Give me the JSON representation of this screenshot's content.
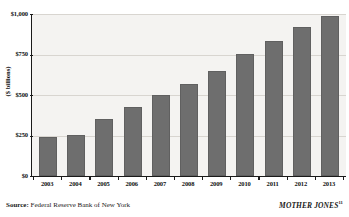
{
  "chart_data": {
    "type": "bar",
    "title": "",
    "subtitle": "",
    "xlabel": "",
    "ylabel": "($ billions)",
    "ylim": [
      0,
      1000
    ],
    "grid": true,
    "legend": null,
    "categories": [
      "2003",
      "2004",
      "2005",
      "2006",
      "2007",
      "2008",
      "2009",
      "2010",
      "2011",
      "2012",
      "2013"
    ],
    "values": [
      240,
      255,
      350,
      425,
      500,
      570,
      650,
      755,
      835,
      920,
      985
    ],
    "ytick_values": [
      0,
      250,
      500,
      750,
      1000
    ],
    "ytick_labels": [
      "$0",
      "$250",
      "$500",
      "$750",
      "$1,000"
    ],
    "bar_color": "#6e6e6e",
    "plot_background": "#f4f3f1",
    "gridline_color": "#d8d5d0",
    "axis_color": "#1a1a1a"
  },
  "footer": {
    "source_label": "Source:",
    "source_value": " Federal Reserve Bank of New York",
    "brand": "MOTHER JONES",
    "brand_footnote": "11"
  }
}
